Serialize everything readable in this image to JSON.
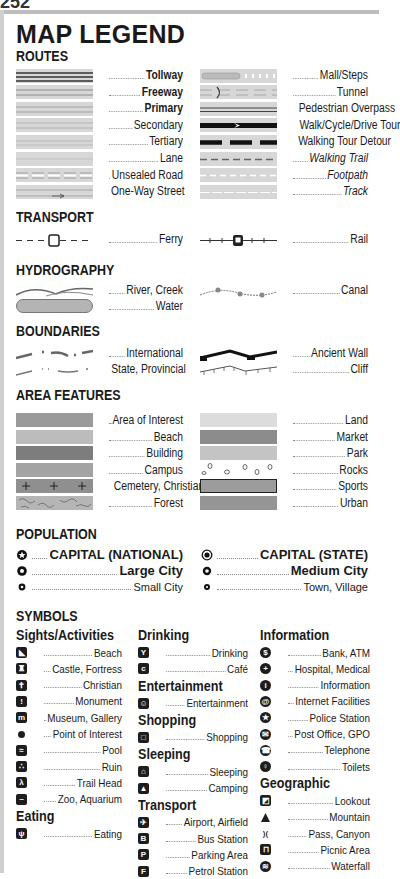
{
  "page_number": "252",
  "title": "MAP LEGEND",
  "sections": {
    "routes": {
      "heading": "ROUTES",
      "left": [
        {
          "label": "Tollway",
          "style": "bold"
        },
        {
          "label": "Freeway",
          "style": "bold"
        },
        {
          "label": "Primary",
          "style": "bold"
        },
        {
          "label": "Secondary",
          "style": "normal"
        },
        {
          "label": "Tertiary",
          "style": "normal"
        },
        {
          "label": "Lane",
          "style": "normal"
        },
        {
          "label": "Unsealed Road",
          "style": "normal"
        },
        {
          "label": "One-Way Street",
          "style": "normal"
        }
      ],
      "right": [
        {
          "label": "Mall/Steps",
          "style": "normal"
        },
        {
          "label": "Tunnel",
          "style": "normal"
        },
        {
          "label": "Pedestrian Overpass",
          "style": "normal"
        },
        {
          "label": "Walk/Cycle/Drive Tour",
          "style": "normal"
        },
        {
          "label": "Walking Tour Detour",
          "style": "normal"
        },
        {
          "label": "Walking Trail",
          "style": "italic"
        },
        {
          "label": "Footpath",
          "style": "italic"
        },
        {
          "label": "Track",
          "style": "italic"
        }
      ]
    },
    "transport": {
      "heading": "TRANSPORT",
      "left": [
        {
          "label": "Ferry"
        }
      ],
      "right": [
        {
          "label": "Rail"
        }
      ]
    },
    "hydrography": {
      "heading": "HYDROGRAPHY",
      "left": [
        {
          "label": "River, Creek"
        },
        {
          "label": "Water"
        }
      ],
      "right": [
        {
          "label": "Canal"
        }
      ]
    },
    "boundaries": {
      "heading": "BOUNDARIES",
      "left": [
        {
          "label": "International"
        },
        {
          "label": "State, Provincial"
        }
      ],
      "right": [
        {
          "label": "Ancient Wall"
        },
        {
          "label": "Cliff"
        }
      ]
    },
    "area_features": {
      "heading": "AREA FEATURES",
      "left": [
        {
          "label": "Area of Interest",
          "color": "#9a9a9a"
        },
        {
          "label": "Beach",
          "color": "#bcbcbc"
        },
        {
          "label": "Building",
          "color": "#7d7d7d"
        },
        {
          "label": "Campus",
          "color": "#a3a3a3"
        },
        {
          "label": "Cemetery, Christian",
          "color": "#8f8f8f"
        },
        {
          "label": "Forest",
          "color": "#b5b5b5"
        }
      ],
      "right": [
        {
          "label": "Land",
          "color": "#dcdcdc"
        },
        {
          "label": "Market",
          "color": "#8c8c8c"
        },
        {
          "label": "Park",
          "color": "#c4c4c4"
        },
        {
          "label": "Rocks",
          "color": "#ffffff"
        },
        {
          "label": "Sports",
          "color": "#9c9c9c"
        },
        {
          "label": "Urban",
          "color": "#959595"
        }
      ]
    },
    "population": {
      "heading": "POPULATION",
      "left": [
        {
          "label": "CAPITAL (NATIONAL)",
          "icon": "star-circle-icon"
        },
        {
          "label": "Large City",
          "icon": "large-dot-icon"
        },
        {
          "label": "Small City",
          "icon": "small-dot-icon"
        }
      ],
      "right": [
        {
          "label": "CAPITAL (STATE)",
          "icon": "ring-dot-icon"
        },
        {
          "label": "Medium City",
          "icon": "medium-dot-icon"
        },
        {
          "label": "Town, Village",
          "icon": "tiny-dot-icon"
        }
      ]
    },
    "symbols": {
      "heading": "SYMBOLS",
      "col1": [
        {
          "group": "Sights/Activities",
          "items": [
            {
              "label": "Beach",
              "icon": "beach-icon"
            },
            {
              "label": "Castle, Fortress",
              "icon": "castle-icon"
            },
            {
              "label": "Christian",
              "icon": "cross-icon"
            },
            {
              "label": "Monument",
              "icon": "monument-icon"
            },
            {
              "label": "Museum, Gallery",
              "icon": "museum-icon"
            },
            {
              "label": "Point of Interest",
              "icon": "dot-icon"
            },
            {
              "label": "Pool",
              "icon": "pool-icon"
            },
            {
              "label": "Ruin",
              "icon": "ruin-icon"
            },
            {
              "label": "Trail Head",
              "icon": "hiker-icon"
            },
            {
              "label": "Zoo, Aquarium",
              "icon": "zoo-icon"
            }
          ]
        },
        {
          "group": "Eating",
          "items": [
            {
              "label": "Eating",
              "icon": "fork-knife-icon"
            }
          ]
        }
      ],
      "col2": [
        {
          "group": "Drinking",
          "items": [
            {
              "label": "Drinking",
              "icon": "glass-icon"
            },
            {
              "label": "Café",
              "icon": "cup-icon"
            }
          ]
        },
        {
          "group": "Entertainment",
          "items": [
            {
              "label": "Entertainment",
              "icon": "masks-icon"
            }
          ]
        },
        {
          "group": "Shopping",
          "items": [
            {
              "label": "Shopping",
              "icon": "bag-icon"
            }
          ]
        },
        {
          "group": "Sleeping",
          "items": [
            {
              "label": "Sleeping",
              "icon": "house-icon"
            },
            {
              "label": "Camping",
              "icon": "tent-icon"
            }
          ]
        },
        {
          "group": "Transport",
          "items": [
            {
              "label": "Airport, Airfield",
              "icon": "plane-icon"
            },
            {
              "label": "Bus Station",
              "icon": "bus-icon"
            },
            {
              "label": "Parking Area",
              "icon": "parking-icon"
            },
            {
              "label": "Petrol Station",
              "icon": "fuel-icon"
            }
          ]
        }
      ],
      "col3": [
        {
          "group": "Information",
          "items": [
            {
              "label": "Bank, ATM",
              "icon": "dollar-icon"
            },
            {
              "label": "Hospital, Medical",
              "icon": "medical-cross-icon"
            },
            {
              "label": "Information",
              "icon": "info-icon"
            },
            {
              "label": "Internet Facilities",
              "icon": "at-sign-icon"
            },
            {
              "label": "Police Station",
              "icon": "police-star-icon"
            },
            {
              "label": "Post Office, GPO",
              "icon": "envelope-icon"
            },
            {
              "label": "Telephone",
              "icon": "telephone-icon"
            },
            {
              "label": "Toilets",
              "icon": "toilets-icon"
            }
          ]
        },
        {
          "group": "Geographic",
          "items": [
            {
              "label": "Lookout",
              "icon": "lookout-icon"
            },
            {
              "label": "Mountain",
              "icon": "mountain-icon"
            },
            {
              "label": "Pass, Canyon",
              "icon": "pass-icon"
            },
            {
              "label": "Picnic Area",
              "icon": "picnic-icon"
            },
            {
              "label": "Waterfall",
              "icon": "waterfall-icon"
            }
          ]
        }
      ]
    }
  }
}
